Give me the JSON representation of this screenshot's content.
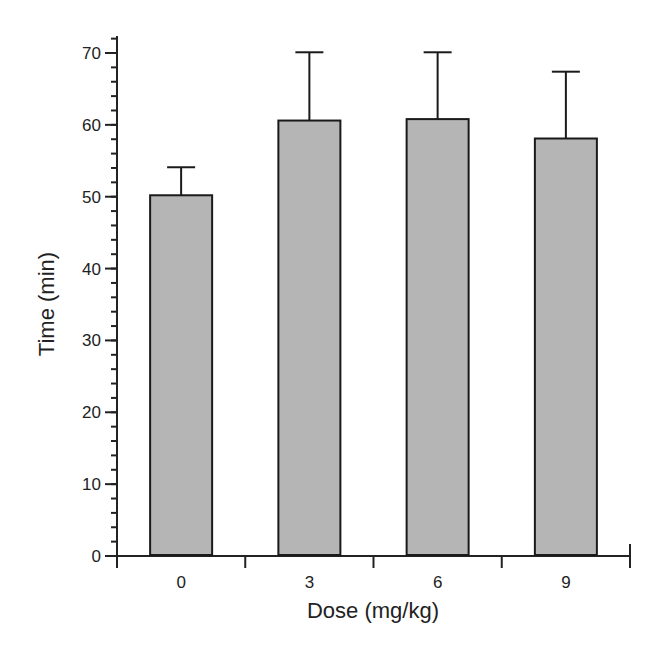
{
  "chart_data": {
    "type": "bar",
    "title": "",
    "xlabel": "Dose (mg/kg)",
    "ylabel": "Time (min)",
    "categories": [
      "0",
      "3",
      "6",
      "9"
    ],
    "values": [
      50.2,
      60.6,
      60.8,
      58.1
    ],
    "error_upper": [
      54.1,
      70.1,
      70.1,
      67.4
    ],
    "error_plus": [
      3.9,
      9.5,
      9.3,
      9.3
    ],
    "ylim": [
      0,
      70
    ],
    "yticks": [
      0,
      10,
      20,
      30,
      40,
      50,
      60,
      70
    ],
    "y_minor_tick_step": 2,
    "grid": false,
    "legend": null,
    "colors": {
      "bar_fill": "#b5b5b5",
      "bar_edge": "#1a1a1a",
      "axis": "#222222"
    }
  }
}
